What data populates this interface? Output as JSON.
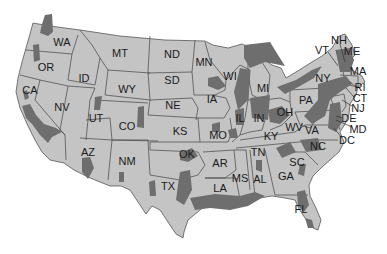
{
  "map": {
    "title": "",
    "colors": {
      "land": "#c4c4c4",
      "shaded": "#6e6e6e",
      "border": "#444444",
      "background": "#ffffff"
    },
    "labels": [
      {
        "id": "WA",
        "x": 62,
        "y": 42
      },
      {
        "id": "OR",
        "x": 46,
        "y": 67
      },
      {
        "id": "CA",
        "x": 30,
        "y": 90
      },
      {
        "id": "ID",
        "x": 84,
        "y": 78
      },
      {
        "id": "NV",
        "x": 62,
        "y": 107
      },
      {
        "id": "MT",
        "x": 120,
        "y": 53
      },
      {
        "id": "WY",
        "x": 127,
        "y": 89
      },
      {
        "id": "UT",
        "x": 96,
        "y": 118
      },
      {
        "id": "CO",
        "x": 127,
        "y": 126
      },
      {
        "id": "AZ",
        "x": 88,
        "y": 152
      },
      {
        "id": "NM",
        "x": 127,
        "y": 161
      },
      {
        "id": "ND",
        "x": 172,
        "y": 54
      },
      {
        "id": "SD",
        "x": 172,
        "y": 80
      },
      {
        "id": "NE",
        "x": 173,
        "y": 105
      },
      {
        "id": "KS",
        "x": 180,
        "y": 131
      },
      {
        "id": "OK",
        "x": 187,
        "y": 154
      },
      {
        "id": "TX",
        "x": 168,
        "y": 186
      },
      {
        "id": "MN",
        "x": 204,
        "y": 62
      },
      {
        "id": "IA",
        "x": 212,
        "y": 99
      },
      {
        "id": "MO",
        "x": 218,
        "y": 135
      },
      {
        "id": "AR",
        "x": 220,
        "y": 163
      },
      {
        "id": "LA",
        "x": 220,
        "y": 188
      },
      {
        "id": "WI",
        "x": 230,
        "y": 76
      },
      {
        "id": "IL",
        "x": 240,
        "y": 118
      },
      {
        "id": "MS",
        "x": 240,
        "y": 178
      },
      {
        "id": "MI",
        "x": 263,
        "y": 88
      },
      {
        "id": "IN",
        "x": 259,
        "y": 118
      },
      {
        "id": "KY",
        "x": 271,
        "y": 136
      },
      {
        "id": "TN",
        "x": 258,
        "y": 152
      },
      {
        "id": "AL",
        "x": 260,
        "y": 179
      },
      {
        "id": "OH",
        "x": 285,
        "y": 112
      },
      {
        "id": "WV",
        "x": 294,
        "y": 127
      },
      {
        "id": "VA",
        "x": 312,
        "y": 130
      },
      {
        "id": "NC",
        "x": 318,
        "y": 146
      },
      {
        "id": "SC",
        "x": 297,
        "y": 162
      },
      {
        "id": "GA",
        "x": 286,
        "y": 176
      },
      {
        "id": "FL",
        "x": 301,
        "y": 209
      },
      {
        "id": "PA",
        "x": 306,
        "y": 100
      },
      {
        "id": "NY",
        "x": 323,
        "y": 78
      },
      {
        "id": "VT",
        "x": 322,
        "y": 50
      },
      {
        "id": "NH",
        "x": 339,
        "y": 40
      },
      {
        "id": "ME",
        "x": 352,
        "y": 51
      },
      {
        "id": "MA",
        "x": 358,
        "y": 71
      },
      {
        "id": "RI",
        "x": 360,
        "y": 87
      },
      {
        "id": "CT",
        "x": 360,
        "y": 98
      },
      {
        "id": "NJ",
        "x": 358,
        "y": 108
      },
      {
        "id": "DE",
        "x": 349,
        "y": 118
      },
      {
        "id": "MD",
        "x": 358,
        "y": 129
      },
      {
        "id": "DC",
        "x": 347,
        "y": 140
      }
    ]
  }
}
